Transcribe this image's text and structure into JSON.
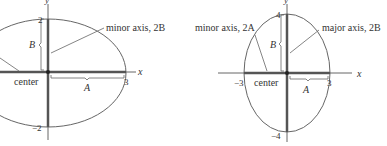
{
  "figures": [
    {
      "id": "horizontal-ellipse",
      "axis_x_label": "x",
      "axis_y_label": "y",
      "tick_top": "2",
      "tick_bottom": "−2",
      "tick_right": "3",
      "label_B": "B",
      "label_A": "A",
      "label_center": "center",
      "label_axis": "minor axis, 2B"
    },
    {
      "id": "vertical-ellipse",
      "axis_x_label": "x",
      "axis_y_label": "y",
      "tick_top": "4",
      "tick_bottom": "−4",
      "tick_right": "3",
      "tick_left": "−3",
      "label_B": "B",
      "label_A": "A",
      "label_center": "center",
      "label_minor_axis": "minor axis, 2A",
      "label_major_axis": "major axis, 2B"
    }
  ],
  "colors": {
    "ellipse": "#555555",
    "axis": "#555555",
    "highlight_axis": "#444444",
    "text": "#333333"
  }
}
